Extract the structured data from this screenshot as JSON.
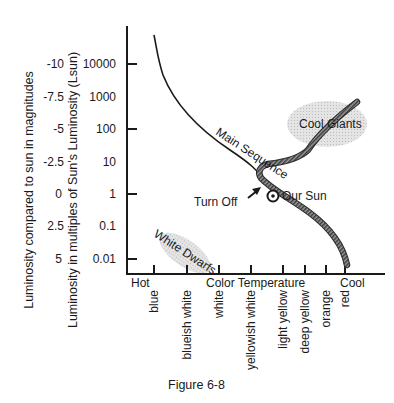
{
  "figure": {
    "caption": "Figure 6-8",
    "y_axis_outer_label": "Luminosity compared to sun in magnitudes",
    "y_axis_inner_label": "Luminosity in multiples of Sun's Luminosity (Lsun)",
    "magnitude_ticks": [
      "-10",
      "-7.5",
      "-5",
      "-2.5",
      "0",
      "2.5",
      "5"
    ],
    "luminosity_ticks": [
      "10000",
      "1000",
      "100",
      "10",
      "1",
      "0.1",
      "0.01"
    ],
    "x_axis": {
      "left_label": "Hot",
      "center_label": "Color Temperature",
      "right_label": "Cool",
      "color_ticks": [
        "blue",
        "blueish white",
        "white",
        "yellowish white",
        "light yellow",
        "deep yellow",
        "orange",
        "red"
      ]
    },
    "annotations": {
      "main_sequence": "Main Sequence",
      "cool_giants": "Cool Giants",
      "white_dwarfs": "White Dwarfs",
      "turn_off": "Turn Off",
      "our_sun": "Our Sun"
    },
    "colors": {
      "ink": "#1a1a1a",
      "region_fill": "#d9d9d9",
      "track": "#555555"
    }
  }
}
